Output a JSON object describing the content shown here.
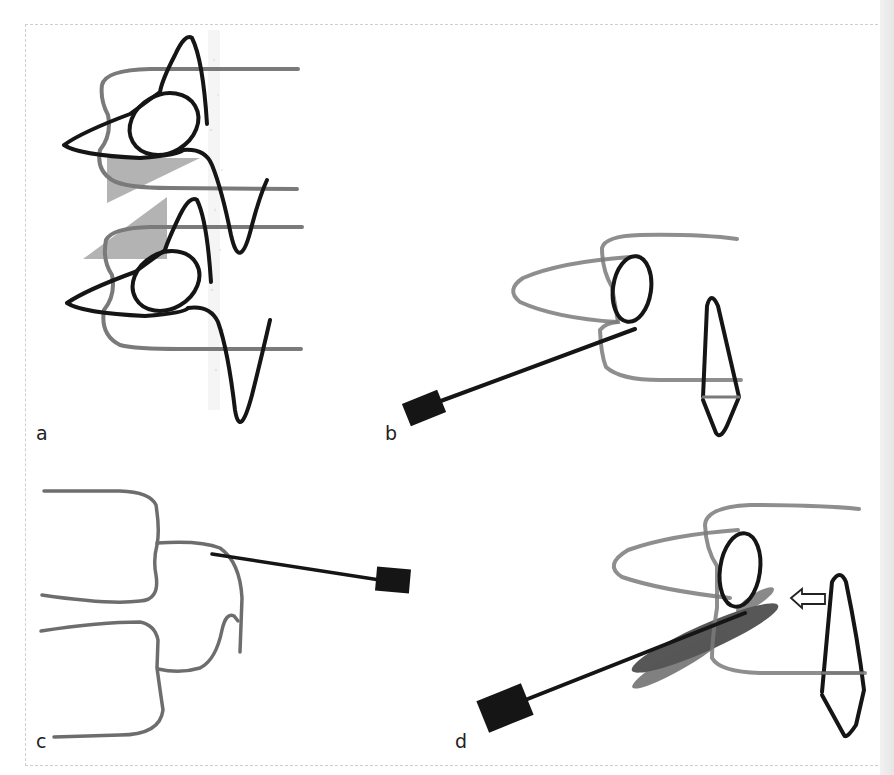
{
  "figure": {
    "panels": [
      {
        "id": "a",
        "label": "a"
      },
      {
        "id": "b",
        "label": "b"
      },
      {
        "id": "c",
        "label": "c"
      },
      {
        "id": "d",
        "label": "d"
      }
    ]
  },
  "colors": {
    "tooth_outline": "#7a7a7a",
    "probe_dark": "#1a1a1a",
    "shaded_wedge": "#b3b3b3",
    "smudge": "#3a3a3a",
    "background": "#ffffff"
  }
}
